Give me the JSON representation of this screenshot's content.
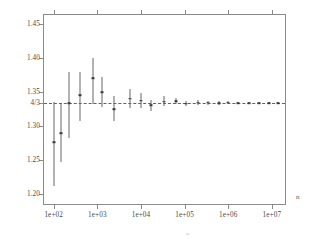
{
  "chart_data": {
    "type": "scatter",
    "title": "",
    "subtitle": "",
    "xlabel": "n",
    "ylabel": "",
    "xscale": "log",
    "xlim": [
      60,
      20000000
    ],
    "ylim": [
      1.185,
      1.463
    ],
    "grid": false,
    "legend": null,
    "reference_line": {
      "label": "4/3",
      "value": 1.333333,
      "style": "dashed"
    },
    "xticks": [
      {
        "value": 100,
        "label": "1e+02"
      },
      {
        "value": 1000,
        "label": "1e+03"
      },
      {
        "value": 10000,
        "label": "1e+04"
      },
      {
        "value": 100000,
        "label": "1e+05"
      },
      {
        "value": 1000000,
        "label": "1e+06"
      },
      {
        "value": 10000000,
        "label": "1e+07"
      }
    ],
    "yticks": [
      {
        "value": 1.45,
        "label": "1.45"
      },
      {
        "value": 1.4,
        "label": "1.40"
      },
      {
        "value": 1.35,
        "label": "1.35"
      },
      {
        "value": 1.333333,
        "label": "4/3"
      },
      {
        "value": 1.3,
        "label": "1.30"
      },
      {
        "value": 1.25,
        "label": "1.25"
      },
      {
        "value": 1.2,
        "label": "1.20"
      }
    ],
    "error_bar_style": "vertical-line-with-center-marker",
    "points": [
      {
        "x": 100,
        "y": 1.2755,
        "lo": 1.2115,
        "hi": 1.3345
      },
      {
        "x": 150,
        "y": 1.289,
        "lo": 1.247,
        "hi": 1.3335
      },
      {
        "x": 230,
        "y": 1.333,
        "lo": 1.2815,
        "hi": 1.379
      },
      {
        "x": 400,
        "y": 1.345,
        "lo": 1.3075,
        "hi": 1.379
      },
      {
        "x": 800,
        "y": 1.37,
        "lo": 1.3325,
        "hi": 1.3995
      },
      {
        "x": 1300,
        "y": 1.3495,
        "lo": 1.3275,
        "hi": 1.372
      },
      {
        "x": 2400,
        "y": 1.3245,
        "lo": 1.3075,
        "hi": 1.344
      },
      {
        "x": 5500,
        "y": 1.34,
        "lo": 1.3265,
        "hi": 1.3535
      },
      {
        "x": 10000,
        "y": 1.337,
        "lo": 1.3255,
        "hi": 1.349
      },
      {
        "x": 17000,
        "y": 1.33,
        "lo": 1.3215,
        "hi": 1.3385
      },
      {
        "x": 33000,
        "y": 1.3355,
        "lo": 1.329,
        "hi": 1.3435
      },
      {
        "x": 62000,
        "y": 1.3365,
        "lo": 1.332,
        "hi": 1.3415
      },
      {
        "x": 110000,
        "y": 1.3325,
        "lo": 1.3285,
        "hi": 1.337
      },
      {
        "x": 200000,
        "y": 1.334,
        "lo": 1.3305,
        "hi": 1.3375
      },
      {
        "x": 350000,
        "y": 1.334,
        "lo": 1.331,
        "hi": 1.337
      },
      {
        "x": 600000,
        "y": 1.3335,
        "lo": 1.331,
        "hi": 1.3362
      },
      {
        "x": 1000000,
        "y": 1.3338,
        "lo": 1.3318,
        "hi": 1.3358
      },
      {
        "x": 1700000,
        "y": 1.3334,
        "lo": 1.3317,
        "hi": 1.3351
      },
      {
        "x": 3000000,
        "y": 1.3333,
        "lo": 1.3319,
        "hi": 1.3348
      },
      {
        "x": 5000000,
        "y": 1.3334,
        "lo": 1.3321,
        "hi": 1.3346
      },
      {
        "x": 8500000,
        "y": 1.3333,
        "lo": 1.3322,
        "hi": 1.3344
      },
      {
        "x": 14000000,
        "y": 1.3333,
        "lo": 1.3324,
        "hi": 1.3343
      }
    ]
  },
  "annotations": {
    "axis_variable": "n",
    "bottom_mark": "~"
  },
  "colors": {
    "frame": "#8a8a8a",
    "data": "#666666",
    "marker": "#3a3a3a",
    "reference": "#555555",
    "text": "#4a4a4a",
    "background": "#ffffff"
  }
}
